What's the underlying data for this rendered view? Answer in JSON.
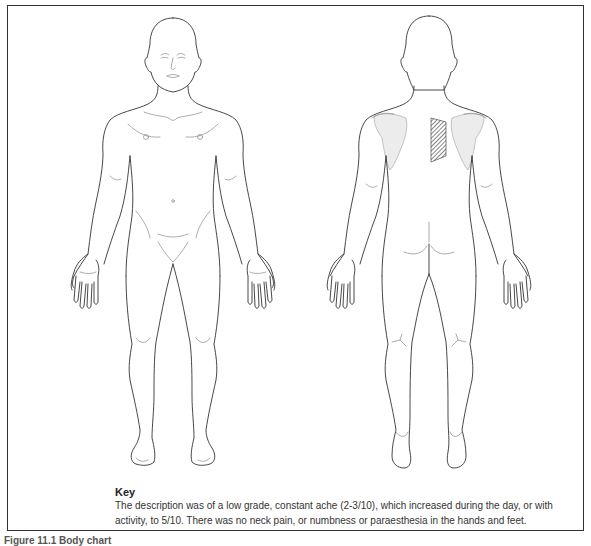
{
  "figure": {
    "views": [
      {
        "id": "anterior",
        "label": "Body chart front view"
      },
      {
        "id": "posterior",
        "label": "Body chart back view"
      }
    ],
    "marked_region": {
      "view": "posterior",
      "location": "right interscapular / medial border of right scapula",
      "pattern": "diagonal-hatch",
      "color": "#555555"
    }
  },
  "key": {
    "title": "Key",
    "text": "The description was of a low grade, constant ache (2-3/10), which increased during the day, or with activity, to 5/10. There was no neck pain, or numbness or paraesthesia in the hands and feet."
  },
  "caption": {
    "text": "Figure 11.1 Body chart"
  }
}
